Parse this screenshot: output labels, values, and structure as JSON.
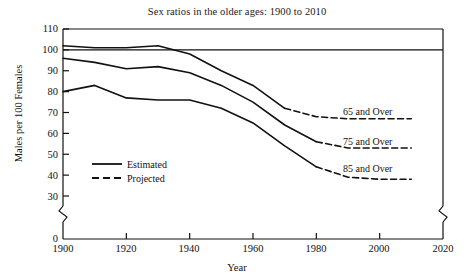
{
  "chart_data": {
    "type": "line",
    "title": "Sex ratios in the older ages: 1900 to 2010",
    "xlabel": "Year",
    "ylabel": "Males per 100 Females",
    "xlim": [
      1900,
      2020
    ],
    "ylim": [
      0,
      110
    ],
    "y_axis_break": true,
    "y_break_range": [
      0,
      30
    ],
    "x_axis_break": true,
    "grid": false,
    "legend_position": "inside-left",
    "xticks": [
      1900,
      1920,
      1940,
      1960,
      1980,
      2000,
      2020
    ],
    "yticks": [
      0,
      30,
      40,
      50,
      60,
      70,
      80,
      90,
      100,
      110
    ],
    "reference_line": {
      "value": 100,
      "label": "100"
    },
    "legend": [
      {
        "key": "estimated",
        "label": "Estimated",
        "style": "solid"
      },
      {
        "key": "projected",
        "label": "Projected",
        "style": "dashed"
      }
    ],
    "series": [
      {
        "name": "65 and Over",
        "label": "65 and Over",
        "estimated": {
          "x": [
            1900,
            1910,
            1920,
            1930,
            1940,
            1950,
            1960,
            1970
          ],
          "y": [
            102,
            101,
            101,
            102,
            98,
            90,
            83,
            72
          ]
        },
        "projected": {
          "x": [
            1970,
            1980,
            1990,
            2000,
            2010
          ],
          "y": [
            72,
            68,
            67,
            67,
            67
          ]
        }
      },
      {
        "name": "75 and Over",
        "label": "75 and Over",
        "estimated": {
          "x": [
            1900,
            1910,
            1920,
            1930,
            1940,
            1950,
            1960,
            1970,
            1980
          ],
          "y": [
            96,
            94,
            91,
            92,
            89,
            83,
            75,
            64,
            56
          ]
        },
        "projected": {
          "x": [
            1980,
            1990,
            2000,
            2010
          ],
          "y": [
            56,
            53,
            53,
            53
          ]
        }
      },
      {
        "name": "85 and Over",
        "label": "85 and Over",
        "estimated": {
          "x": [
            1900,
            1910,
            1920,
            1930,
            1940,
            1950,
            1960,
            1970,
            1980
          ],
          "y": [
            80,
            83,
            77,
            76,
            76,
            72,
            65,
            54,
            44
          ]
        },
        "projected": {
          "x": [
            1980,
            1990,
            2000,
            2010
          ],
          "y": [
            44,
            39,
            38,
            38
          ]
        }
      }
    ]
  },
  "axis": {
    "yticks": [
      "110",
      "100",
      "90",
      "80",
      "70",
      "60",
      "50",
      "40",
      "30",
      "0"
    ],
    "xticks": [
      "1900",
      "1920",
      "1940",
      "1960",
      "1980",
      "2000",
      "2020"
    ]
  },
  "legend": {
    "estimated_label": "Estimated",
    "projected_label": "Projected"
  },
  "series_labels": {
    "s65": "65 and Over",
    "s75": "75 and Over",
    "s85": "85 and Over"
  },
  "title": "Sex ratios in the older ages: 1900 to 2010",
  "xlabel": "Year",
  "ylabel": "Males per 100 Females",
  "colors": {
    "line": "#111111",
    "background": "#ffffff",
    "text": "#1a1a1a"
  }
}
